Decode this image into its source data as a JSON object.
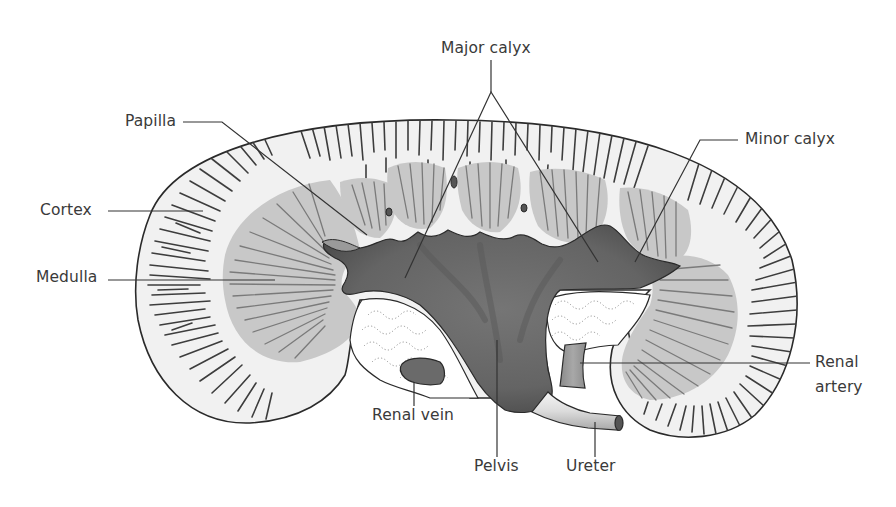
{
  "figure": {
    "colors": {
      "background": "#ffffff",
      "outline": "#2a2a2a",
      "cortex_fill": "#f1f1f1",
      "cortex_stripes": "#3d3d3d",
      "medulla_fill": "#c8c8c8",
      "medulla_stripes": "#7a7a7a",
      "pelvis_fill": "#6b6b6b",
      "pelvis_dark": "#4a4a4a",
      "fat_fill": "#ffffff",
      "fat_dots": "#8a8a8a",
      "vessel_fill": "#6a6a6a",
      "artery_fill": "#9a9a9a",
      "ureter_fill": "#e2e2e2",
      "label_text": "#3a3a3a",
      "leader_line": "#333333"
    }
  },
  "labels": {
    "major_calyx": "Major calyx",
    "papilla": "Papilla",
    "cortex": "Cortex",
    "medulla": "Medulla",
    "minor_calyx": "Minor calyx",
    "renal_artery": "Renal\nartery",
    "renal_vein": "Renal vein",
    "pelvis": "Pelvis",
    "ureter": "Ureter"
  }
}
